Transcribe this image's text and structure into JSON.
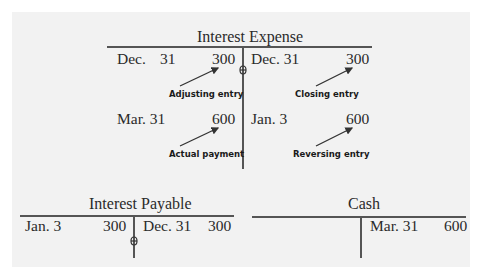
{
  "diagram": {
    "type": "t-accounts",
    "accounts": [
      {
        "name": "Interest Expense",
        "debits": [
          {
            "date": "Dec.",
            "day": "31",
            "amount": "300",
            "note": "Adjusting entry"
          },
          {
            "date": "Mar. 31",
            "amount": "600",
            "note": "Actual payment"
          }
        ],
        "credits": [
          {
            "date": "Dec. 31",
            "amount": "300",
            "note": "Closing entry"
          },
          {
            "date": "Jan. 3",
            "amount": "600",
            "note": "Reversing entry"
          }
        ]
      },
      {
        "name": "Interest Payable",
        "debits": [
          {
            "date": "Jan. 3",
            "amount": "300"
          }
        ],
        "credits": [
          {
            "date": "Dec. 31",
            "amount": "300"
          }
        ]
      },
      {
        "name": "Cash",
        "debits": [],
        "credits": [
          {
            "date": "Mar. 31",
            "amount": "600"
          }
        ]
      }
    ]
  },
  "colors": {
    "panel_background": "#f2f2f2",
    "line": "#555555",
    "text": "#2a2a2a"
  }
}
